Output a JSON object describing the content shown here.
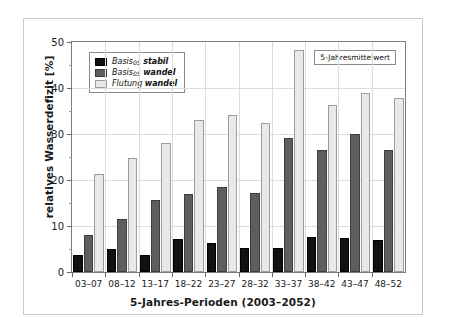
{
  "chart_data": {
    "type": "bar",
    "title": "",
    "xlabel": "5-Jahres-Perioden (2003–2052)",
    "ylabel": "relatives Wasserdefizit [%]",
    "ylim": [
      0,
      50
    ],
    "yticks": [
      0,
      10,
      20,
      30,
      40,
      50
    ],
    "ytick_labels": [
      "0",
      "10",
      "20",
      "30",
      "40",
      "50"
    ],
    "yminor_step": 5,
    "grid": true,
    "legend_position": "top-left",
    "categories": [
      "03–07",
      "08–12",
      "13–17",
      "18–22",
      "23–27",
      "28–32",
      "33–37",
      "38–42",
      "43–47",
      "48–52"
    ],
    "series": [
      {
        "name": "Basis05 stabil",
        "name_base": "Basis",
        "name_sub": "05",
        "name_tail": "stabil",
        "color": "#111111",
        "values": [
          3.7,
          4.9,
          3.8,
          7.1,
          6.4,
          5.2,
          5.3,
          7.7,
          7.4,
          6.9
        ]
      },
      {
        "name": "Basis05 wandel",
        "name_base": "Basis",
        "name_sub": "05",
        "name_tail": "wandel",
        "color": "#5e5e5e",
        "values": [
          8.1,
          11.5,
          15.7,
          16.9,
          18.4,
          17.1,
          29.2,
          26.5,
          30.1,
          26.6
        ]
      },
      {
        "name": "Flutung wandel",
        "name_base": "Flutung",
        "name_sub": "",
        "name_tail": "wandel",
        "color": "#e9e9e9",
        "values": [
          21.3,
          24.8,
          28.1,
          33.1,
          34.2,
          32.4,
          48.3,
          36.2,
          38.9,
          37.9
        ]
      }
    ],
    "annotation": "5-Jahresmittelwert"
  }
}
